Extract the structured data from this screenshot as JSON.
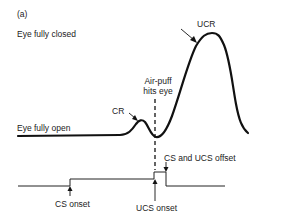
{
  "figure": {
    "panel_label": "(a)",
    "labels": {
      "eye_closed": "Eye fully closed",
      "eye_open": "Eye fully open",
      "ucr": "UCR",
      "cr": "CR",
      "air_puff_line1": "Air-puff",
      "air_puff_line2": "hits eye",
      "cs_ucs_offset": "CS and  UCS offset",
      "cs_onset": "CS onset",
      "ucs_onset": "UCS onset"
    },
    "colors": {
      "line": "#111111",
      "text": "#222222",
      "background": "#ffffff"
    }
  }
}
